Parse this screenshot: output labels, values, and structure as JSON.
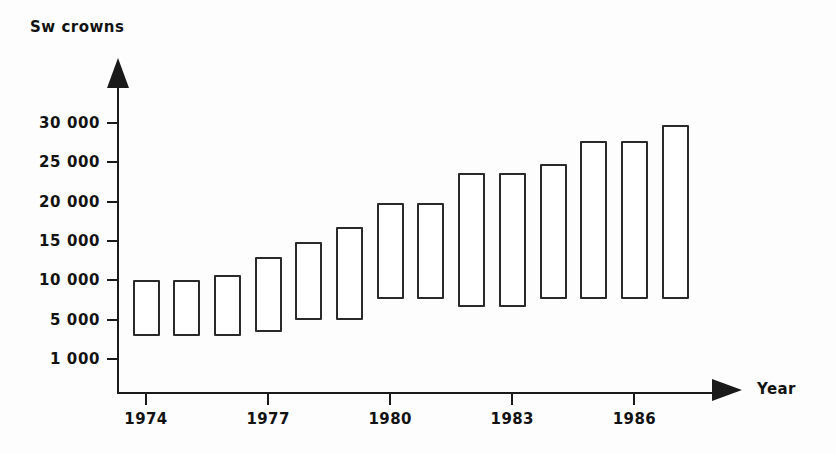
{
  "chart_data": {
    "type": "bar",
    "title": "",
    "ylabel": "Sw crowns",
    "xlabel": "Year",
    "grid": false,
    "legend": null,
    "categories": [
      "1974",
      "1975",
      "1976",
      "1977",
      "1978",
      "1979",
      "1980",
      "1981",
      "1982",
      "1983",
      "1984",
      "1985",
      "1986",
      "1987"
    ],
    "x_tick_labels": [
      "1974",
      "1977",
      "1980",
      "1983",
      "1986"
    ],
    "y_tick_labels": [
      "30 000",
      "25 000",
      "20 000",
      "15 000",
      "10 000",
      "5 000",
      "1 000"
    ],
    "y_tick_values": [
      30000,
      25000,
      20000,
      15000,
      10000,
      5000,
      1000
    ],
    "ylim": [
      1000,
      31500
    ],
    "series": [
      {
        "name": "range",
        "low": [
          3300,
          3300,
          3300,
          3700,
          4900,
          4900,
          7600,
          7600,
          6600,
          6600,
          7600,
          7600,
          7600,
          7600
        ],
        "high": [
          10000,
          10000,
          10700,
          12900,
          14800,
          16800,
          19800,
          19800,
          23700,
          23700,
          24800,
          27700,
          27700,
          29700
        ]
      }
    ]
  },
  "style": {
    "line_color": "#1a1a1a",
    "bar_stroke": "#2a2a2a",
    "bar_fill": "#ffffff",
    "background": "#fdfdfd"
  }
}
